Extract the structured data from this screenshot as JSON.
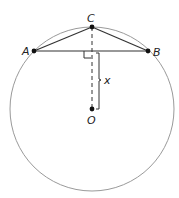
{
  "diagram": {
    "type": "geometry",
    "points": {
      "A": {
        "label": "A",
        "x": 34,
        "y": 51
      },
      "B": {
        "label": "B",
        "x": 148,
        "y": 51
      },
      "C": {
        "label": "C",
        "x": 92,
        "y": 27
      },
      "O": {
        "label": "O",
        "x": 92,
        "y": 109
      }
    },
    "circle": {
      "cx": 92,
      "cy": 109,
      "r": 82,
      "stroke": "#999999"
    },
    "segments": [
      {
        "from": "A",
        "to": "B",
        "style": "solid"
      },
      {
        "from": "A",
        "to": "C",
        "style": "solid"
      },
      {
        "from": "C",
        "to": "B",
        "style": "solid"
      },
      {
        "from": "C",
        "to": "O",
        "style": "dashed"
      }
    ],
    "annotations": {
      "right_angle": {
        "at": "midpoint of AB",
        "x": 92,
        "y": 51
      },
      "distance_label": "x",
      "distance_description": "distance from chord AB to center O"
    },
    "colors": {
      "line": "#333333",
      "circle": "#999999",
      "point": "#111111"
    }
  }
}
